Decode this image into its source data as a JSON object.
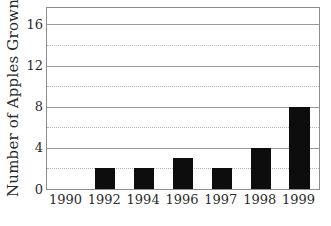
{
  "chart_data": {
    "type": "bar",
    "title": "",
    "subtitle": "",
    "xlabel": "",
    "ylabel": "Number of Apples Grown",
    "categories": [
      "1990",
      "1992",
      "1994",
      "1996",
      "1997",
      "1998",
      "1999"
    ],
    "values": [
      0,
      2,
      2,
      3,
      2,
      4,
      8
    ],
    "ylim": [
      0,
      17.6
    ],
    "y_major_ticks": [
      0,
      4,
      8,
      12,
      16
    ],
    "y_major_tick_labels": [
      "0",
      "4",
      "8",
      "12",
      "16"
    ],
    "y_minor_gridlines": [
      2,
      6,
      10,
      14
    ],
    "grid": "horizontal-major-solid-minor-dotted",
    "legend": "none",
    "bar_color": "#0d0d0d",
    "axis_color": "#8d8d8d",
    "major_gridline_color": "#9a9a9a",
    "minor_gridline_color": "#b4b4b4",
    "background_color": "#ffffff",
    "text_color": "#2b2b2b"
  }
}
